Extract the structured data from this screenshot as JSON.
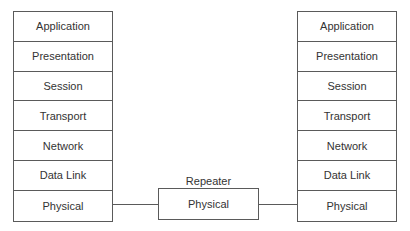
{
  "diagram": {
    "left_stack": {
      "layers": [
        "Application",
        "Presentation",
        "Session",
        "Transport",
        "Network",
        "Data Link",
        "Physical"
      ]
    },
    "right_stack": {
      "layers": [
        "Application",
        "Presentation",
        "Session",
        "Transport",
        "Network",
        "Data Link",
        "Physical"
      ]
    },
    "repeater": {
      "label": "Repeater",
      "layer": "Physical"
    },
    "colors": {
      "line": "#5a5a5a",
      "text": "#333333",
      "background": "#ffffff"
    }
  }
}
